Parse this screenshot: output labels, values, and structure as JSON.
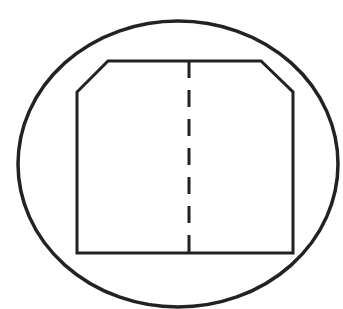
{
  "diagram": {
    "canvas": {
      "width": 343,
      "height": 309,
      "background": "#ffffff"
    },
    "stroke_color": "#222222",
    "ellipse": {
      "cx": 178,
      "cy": 164,
      "rx": 160,
      "ry": 143,
      "stroke_width": 3.5
    },
    "shape": {
      "points": "77,253 77,92 108,61 261,61 293,92 293,253",
      "stroke_width": 3
    },
    "divider": {
      "x": 189,
      "y1": 61,
      "y2": 253,
      "dash": "17 12",
      "stroke_width": 3
    }
  }
}
